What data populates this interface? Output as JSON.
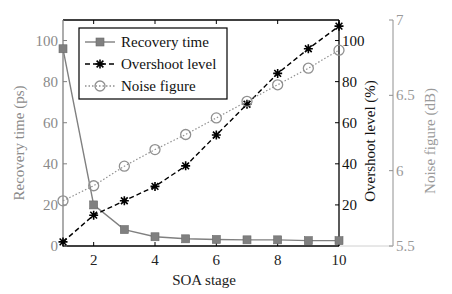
{
  "chart_data": {
    "type": "line",
    "title": "",
    "xlabel": "SOA stage",
    "x": [
      1,
      2,
      3,
      4,
      5,
      6,
      7,
      8,
      9,
      10
    ],
    "xticks": [
      2,
      4,
      6,
      8,
      10
    ],
    "xlim": [
      1,
      10
    ],
    "axes": {
      "left": {
        "label": "Recovery time (ps)",
        "ylim": [
          0,
          110
        ],
        "ticks": [
          0,
          20,
          40,
          60,
          80,
          100
        ],
        "color": "#808080"
      },
      "right1": {
        "label": "Overshoot level (%)",
        "ylim": [
          0,
          110
        ],
        "ticks": [
          20,
          40,
          60,
          80,
          100
        ],
        "color": "#000000"
      },
      "right2": {
        "label": "Noise figure (dB)",
        "ylim": [
          5.5,
          7
        ],
        "ticks": [
          5.5,
          6,
          6.5,
          7
        ],
        "tick_labels": [
          "5.5",
          "6",
          "6.5",
          "7"
        ],
        "color": "#909090"
      }
    },
    "series": [
      {
        "name": "Recovery time",
        "axis": "left",
        "marker": "square",
        "line": "solid",
        "color": "#808080",
        "values": [
          96,
          20,
          8,
          4.5,
          3.5,
          3.2,
          3,
          3,
          2.6,
          2.6
        ]
      },
      {
        "name": "Overshoot level",
        "axis": "right1",
        "marker": "asterisk",
        "line": "dashed",
        "color": "#000000",
        "values": [
          2,
          15,
          22,
          29,
          39,
          54,
          69,
          84,
          96,
          107
        ]
      },
      {
        "name": "Noise figure",
        "axis": "right2",
        "marker": "circle",
        "line": "dotted",
        "color": "#909090",
        "values": [
          5.8,
          5.9,
          6.03,
          6.14,
          6.24,
          6.35,
          6.46,
          6.57,
          6.68,
          6.8
        ]
      }
    ],
    "legend": {
      "position": "upper left",
      "entries": [
        "Recovery time",
        "Overshoot level",
        "Noise figure"
      ]
    },
    "grid": false
  }
}
